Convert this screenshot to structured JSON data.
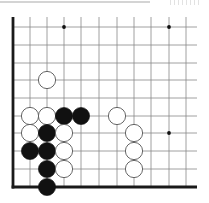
{
  "board": {
    "title": "Go problem diagram (lower-left corner)",
    "colors": {
      "background": "#ffffff",
      "grid_line": "#888888",
      "edge_line": "#1a1a1a",
      "black_stone": "#111111",
      "white_stone_fill": "#ffffff",
      "white_stone_stroke": "#555555",
      "star_point": "#111111"
    },
    "grid": {
      "columns_x": [
        13,
        30,
        47,
        64,
        81,
        99,
        117,
        134,
        151,
        169,
        186
      ],
      "rows_y": [
        27,
        45,
        63,
        80,
        98,
        116,
        133,
        151,
        169,
        187
      ],
      "left_edge_x": 13,
      "bottom_edge_y": 187,
      "line_right_end_x": 197,
      "line_top_start_y": 17
    },
    "star_points": [
      {
        "col": 3,
        "row": 0
      },
      {
        "col": 9,
        "row": 0
      },
      {
        "col": 9,
        "row": 6
      }
    ],
    "stones": [
      {
        "color": "white",
        "col": 2,
        "row": 3
      },
      {
        "color": "white",
        "col": 1,
        "row": 5
      },
      {
        "color": "white",
        "col": 2,
        "row": 5
      },
      {
        "color": "black",
        "col": 3,
        "row": 5
      },
      {
        "color": "black",
        "col": 4,
        "row": 5
      },
      {
        "color": "white",
        "col": 6,
        "row": 5
      },
      {
        "color": "white",
        "col": 1,
        "row": 6
      },
      {
        "color": "black",
        "col": 2,
        "row": 6
      },
      {
        "color": "white",
        "col": 3,
        "row": 6
      },
      {
        "color": "white",
        "col": 7,
        "row": 6
      },
      {
        "color": "black",
        "col": 1,
        "row": 7
      },
      {
        "color": "black",
        "col": 2,
        "row": 7
      },
      {
        "color": "white",
        "col": 3,
        "row": 7
      },
      {
        "color": "white",
        "col": 7,
        "row": 7
      },
      {
        "color": "black",
        "col": 2,
        "row": 8
      },
      {
        "color": "white",
        "col": 3,
        "row": 8
      },
      {
        "color": "white",
        "col": 7,
        "row": 8
      },
      {
        "color": "black",
        "col": 2,
        "row": 9
      }
    ],
    "stone_radius": 8.6
  }
}
